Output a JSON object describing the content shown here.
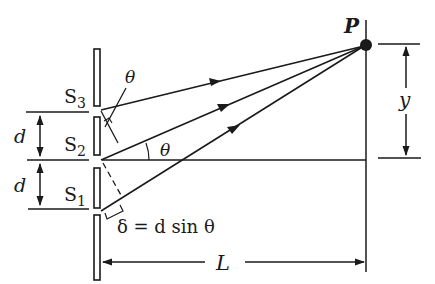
{
  "diagram": {
    "type": "three-slit interference geometry",
    "labels": {
      "point": "P",
      "slit3": "S",
      "slit3_sub": "3",
      "slit2": "S",
      "slit2_sub": "2",
      "slit1": "S",
      "slit1_sub": "1",
      "spacing_upper": "d",
      "spacing_lower": "d",
      "angle_top": "θ",
      "angle_axis": "θ",
      "path_difference": "δ = d sin θ",
      "screen_distance": "L",
      "height": "y"
    },
    "colors": {
      "ink": "#1a1a1a",
      "background": "#ffffff"
    }
  }
}
